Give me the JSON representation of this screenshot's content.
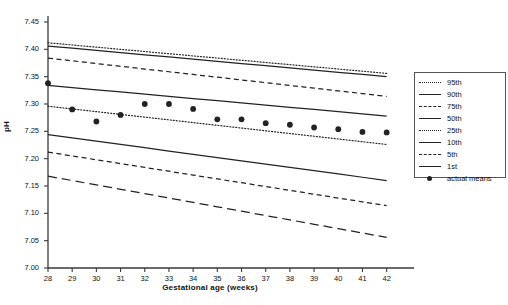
{
  "chart_data": {
    "type": "line",
    "title": "",
    "xlabel": "Gestational age (weeks)",
    "ylabel": "pH",
    "xlim": [
      28,
      42.8
    ],
    "ylim": [
      7.0,
      7.45
    ],
    "xticks": [
      28,
      29,
      30,
      31,
      32,
      33,
      34,
      35,
      36,
      37,
      38,
      39,
      40,
      41,
      42
    ],
    "yticks": [
      "7.00",
      "7.05",
      "7.10",
      "7.15",
      "7.20",
      "7.25",
      "7.30",
      "7.35",
      "7.40",
      "7.45"
    ],
    "grid": false,
    "legend_position": "right",
    "x": [
      28,
      29,
      30,
      31,
      32,
      33,
      34,
      35,
      36,
      37,
      38,
      39,
      40,
      41,
      42
    ],
    "series": [
      {
        "name": "95th",
        "style": "dotted",
        "color": "#222222",
        "values": [
          7.412,
          7.408,
          7.404,
          7.4,
          7.396,
          7.392,
          7.388,
          7.384,
          7.38,
          7.376,
          7.372,
          7.368,
          7.364,
          7.36,
          7.356
        ]
      },
      {
        "name": "90th",
        "style": "solid",
        "color": "#222222",
        "values": [
          7.406,
          7.402,
          7.398,
          7.394,
          7.39,
          7.386,
          7.382,
          7.378,
          7.374,
          7.37,
          7.366,
          7.362,
          7.358,
          7.354,
          7.35
        ]
      },
      {
        "name": "75th",
        "style": "dashed-short",
        "color": "#222222",
        "values": [
          7.384,
          7.379,
          7.374,
          7.369,
          7.364,
          7.359,
          7.354,
          7.349,
          7.344,
          7.339,
          7.334,
          7.329,
          7.324,
          7.319,
          7.314
        ]
      },
      {
        "name": "50th",
        "style": "solid",
        "color": "#222222",
        "values": [
          7.334,
          7.33,
          7.326,
          7.322,
          7.318,
          7.314,
          7.31,
          7.306,
          7.302,
          7.298,
          7.294,
          7.29,
          7.286,
          7.282,
          7.278
        ]
      },
      {
        "name": "25th",
        "style": "dotted",
        "color": "#222222",
        "values": [
          7.296,
          7.291,
          7.286,
          7.281,
          7.276,
          7.271,
          7.266,
          7.261,
          7.256,
          7.251,
          7.246,
          7.241,
          7.236,
          7.231,
          7.226
        ]
      },
      {
        "name": "10th",
        "style": "solid",
        "color": "#222222",
        "values": [
          7.244,
          7.238,
          7.232,
          7.226,
          7.22,
          7.214,
          7.208,
          7.202,
          7.196,
          7.19,
          7.184,
          7.178,
          7.172,
          7.166,
          7.16
        ]
      },
      {
        "name": "5th",
        "style": "dashed-short",
        "color": "#222222",
        "values": [
          7.212,
          7.205,
          7.198,
          7.191,
          7.184,
          7.177,
          7.17,
          7.163,
          7.156,
          7.149,
          7.142,
          7.135,
          7.128,
          7.121,
          7.114
        ]
      },
      {
        "name": "1st",
        "style": "dashed-long",
        "color": "#222222",
        "values": [
          7.168,
          7.16,
          7.152,
          7.144,
          7.136,
          7.128,
          7.12,
          7.112,
          7.104,
          7.096,
          7.088,
          7.08,
          7.072,
          7.064,
          7.056
        ]
      }
    ],
    "points": {
      "name": "actual means",
      "marker": "filled-circle",
      "color": "#222222",
      "values": [
        7.338,
        7.29,
        7.268,
        7.28,
        7.3,
        7.3,
        7.291,
        7.272,
        7.272,
        7.265,
        7.262,
        7.257,
        7.254,
        7.249,
        7.248
      ]
    }
  },
  "legend": {
    "items": [
      {
        "label": "95th",
        "key": "dotted"
      },
      {
        "label": "90th",
        "key": "solid"
      },
      {
        "label": "75th",
        "key": "dashed-short"
      },
      {
        "label": "50th",
        "key": "solid"
      },
      {
        "label": "25th",
        "key": "dotted"
      },
      {
        "label": "10th",
        "key": "solid"
      },
      {
        "label": "5th",
        "key": "dashed-short"
      },
      {
        "label": "1st",
        "key": "solid"
      },
      {
        "label": "actual means",
        "key": "marker"
      }
    ]
  }
}
